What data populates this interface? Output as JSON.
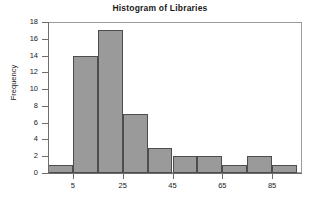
{
  "chart_data": {
    "type": "bar",
    "title": "Histogram of Libraries",
    "xlabel": "",
    "ylabel": "Frequency",
    "grid": false,
    "legend": null,
    "ylim": [
      0,
      18
    ],
    "xlim": [
      -5,
      97
    ],
    "bin_width": 10,
    "bin_starts": [
      -5,
      5,
      15,
      25,
      35,
      45,
      55,
      65,
      75,
      85
    ],
    "bin_ends": [
      5,
      15,
      25,
      35,
      45,
      55,
      65,
      75,
      85,
      95
    ],
    "categories": [
      "-5",
      "5",
      "15",
      "25",
      "35",
      "45",
      "55",
      "65",
      "75",
      "85"
    ],
    "values": [
      1,
      14,
      17,
      7,
      3,
      2,
      2,
      1,
      2,
      1
    ],
    "y_ticks": [
      0,
      2,
      4,
      6,
      8,
      10,
      12,
      14,
      16,
      18
    ],
    "y_tick_labels": [
      "0",
      "2",
      "4",
      "6",
      "8",
      "10",
      "12",
      "14",
      "16",
      "18"
    ],
    "x_ticks": [
      5,
      25,
      45,
      65,
      85
    ],
    "x_tick_labels": [
      "5",
      "25",
      "45",
      "65",
      "85"
    ],
    "bar_color": "#9a9a9a",
    "bar_border_color": "#4d4d4d",
    "axis_color": "#6d6d6d",
    "frame_color": "#9b9b9b",
    "background": "#ffffff"
  },
  "figure": {
    "title": "Histogram of Libraries",
    "y_axis_title": "Frequency"
  }
}
